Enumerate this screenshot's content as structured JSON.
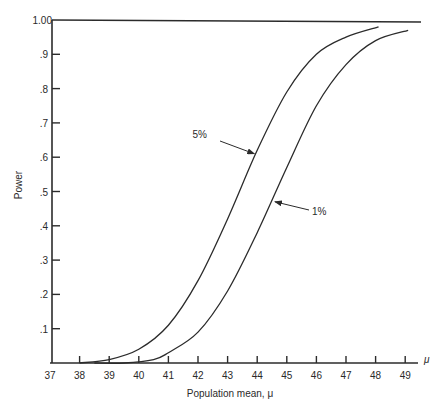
{
  "chart_data": {
    "type": "line",
    "title": "",
    "xlabel": "Population mean, μ",
    "ylabel": "Power",
    "x_axis_end_label": "μ",
    "xlim": [
      37,
      49.5
    ],
    "ylim": [
      0,
      1.0
    ],
    "grid": false,
    "x_ticks": [
      37,
      38,
      39,
      40,
      41,
      42,
      43,
      44,
      45,
      46,
      47,
      48,
      49
    ],
    "x_tick_labels": [
      "37",
      "38",
      "39",
      "40",
      "41",
      "42",
      "43",
      "44",
      "45",
      "46",
      "47",
      "48",
      "49"
    ],
    "y_ticks": [
      0.1,
      0.2,
      0.3,
      0.4,
      0.5,
      0.6,
      0.7,
      0.8,
      0.9,
      1.0
    ],
    "y_tick_labels": [
      ".1",
      ".2",
      ".3",
      ".4",
      ".5",
      ".6",
      ".7",
      ".8",
      ".9",
      "1.00"
    ],
    "reference_line": {
      "y": 1.0,
      "description": "horizontal line at power 1.00"
    },
    "series": [
      {
        "name": "5%",
        "x": [
          38.0,
          39.0,
          40.0,
          41.0,
          42.0,
          43.0,
          44.0,
          45.0,
          46.0,
          47.0,
          48.1
        ],
        "values": [
          0.0,
          0.01,
          0.04,
          0.11,
          0.24,
          0.42,
          0.62,
          0.79,
          0.9,
          0.95,
          0.98
        ]
      },
      {
        "name": "1%",
        "x": [
          38.5,
          39.5,
          40.5,
          41.0,
          42.0,
          43.0,
          44.0,
          45.0,
          46.0,
          47.0,
          48.0,
          49.1
        ],
        "values": [
          0.0,
          0.0,
          0.01,
          0.03,
          0.09,
          0.21,
          0.38,
          0.57,
          0.75,
          0.87,
          0.94,
          0.97
        ]
      }
    ],
    "annotations": [
      {
        "text": "5%",
        "arrow_to": {
          "x": 43.9,
          "y": 0.61
        }
      },
      {
        "text": "1%",
        "arrow_to": {
          "x": 44.6,
          "y": 0.47
        }
      }
    ]
  }
}
